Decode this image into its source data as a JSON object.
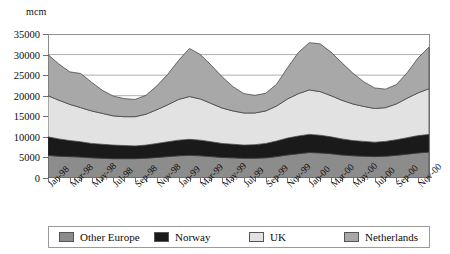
{
  "axis": {
    "unit_label": "mcm",
    "y_ticks": [
      0,
      5000,
      10000,
      15000,
      20000,
      25000,
      30000,
      35000
    ],
    "x_tick_labels": [
      "Jan-98",
      "Mar-98",
      "May-98",
      "Jul-98",
      "Sep-98",
      "Nov-98",
      "Jan-99",
      "Mar-99",
      "May-99",
      "Jul-99",
      "Sep-99",
      "Nov-99",
      "Jan-00",
      "Mar-00",
      "May-00",
      "Jul-00",
      "Sep-00",
      "Nov-00"
    ]
  },
  "legend": {
    "items": [
      {
        "label": "Other Europe",
        "color": "#8c8c8c"
      },
      {
        "label": "Norway",
        "color": "#1a1a1a"
      },
      {
        "label": "UK",
        "color": "#e2e2e2"
      },
      {
        "label": "Netherlands",
        "color": "#a8a8a8"
      }
    ]
  },
  "chart_data": {
    "type": "area",
    "stacked": true,
    "title": "",
    "xlabel": "",
    "ylabel": "mcm",
    "ylim": [
      0,
      35000
    ],
    "grid": true,
    "legend_position": "bottom",
    "x": [
      "Jan-98",
      "Feb-98",
      "Mar-98",
      "Apr-98",
      "May-98",
      "Jun-98",
      "Jul-98",
      "Aug-98",
      "Sep-98",
      "Oct-98",
      "Nov-98",
      "Dec-98",
      "Jan-99",
      "Feb-99",
      "Mar-99",
      "Apr-99",
      "May-99",
      "Jun-99",
      "Jul-99",
      "Aug-99",
      "Sep-99",
      "Oct-99",
      "Nov-99",
      "Dec-99",
      "Jan-00",
      "Feb-00",
      "Mar-00",
      "Apr-00",
      "May-00",
      "Jun-00",
      "Jul-00",
      "Aug-00",
      "Sep-00",
      "Oct-00",
      "Nov-00",
      "Dec-00"
    ],
    "series": [
      {
        "name": "Other Europe",
        "color": "#8c8c8c",
        "values": [
          5500,
          5300,
          5200,
          5100,
          4900,
          4800,
          4700,
          4700,
          4700,
          4800,
          5000,
          5200,
          5400,
          5500,
          5400,
          5200,
          5000,
          4900,
          4800,
          4800,
          4900,
          5200,
          5600,
          5900,
          6200,
          6100,
          5900,
          5600,
          5400,
          5300,
          5200,
          5300,
          5500,
          5800,
          6100,
          6300
        ]
      },
      {
        "name": "Norway",
        "color": "#1a1a1a",
        "values": [
          4500,
          4200,
          3900,
          3700,
          3500,
          3400,
          3300,
          3200,
          3100,
          3200,
          3400,
          3600,
          3800,
          3900,
          3800,
          3600,
          3400,
          3300,
          3200,
          3300,
          3500,
          3800,
          4100,
          4300,
          4400,
          4300,
          4100,
          3900,
          3700,
          3600,
          3500,
          3600,
          3800,
          4000,
          4200,
          4300
        ]
      },
      {
        "name": "UK",
        "color": "#e2e2e2",
        "values": [
          10000,
          9400,
          8800,
          8300,
          7900,
          7500,
          7100,
          7000,
          7100,
          7500,
          8200,
          9000,
          9900,
          10400,
          10000,
          9300,
          8600,
          8100,
          7800,
          7700,
          7900,
          8500,
          9500,
          10300,
          10800,
          10600,
          10000,
          9400,
          8900,
          8500,
          8200,
          8200,
          8700,
          9600,
          10400,
          11100
        ]
      },
      {
        "name": "Netherlands",
        "color": "#a8a8a8",
        "values": [
          10000,
          8800,
          7900,
          8300,
          7000,
          5600,
          4800,
          4400,
          4200,
          4600,
          5800,
          7400,
          9500,
          11700,
          10800,
          9300,
          7600,
          5900,
          4700,
          4300,
          4300,
          5300,
          7600,
          10000,
          11500,
          11600,
          10600,
          9100,
          7500,
          6000,
          5000,
          4500,
          4700,
          6200,
          8500,
          10100
        ]
      }
    ]
  }
}
